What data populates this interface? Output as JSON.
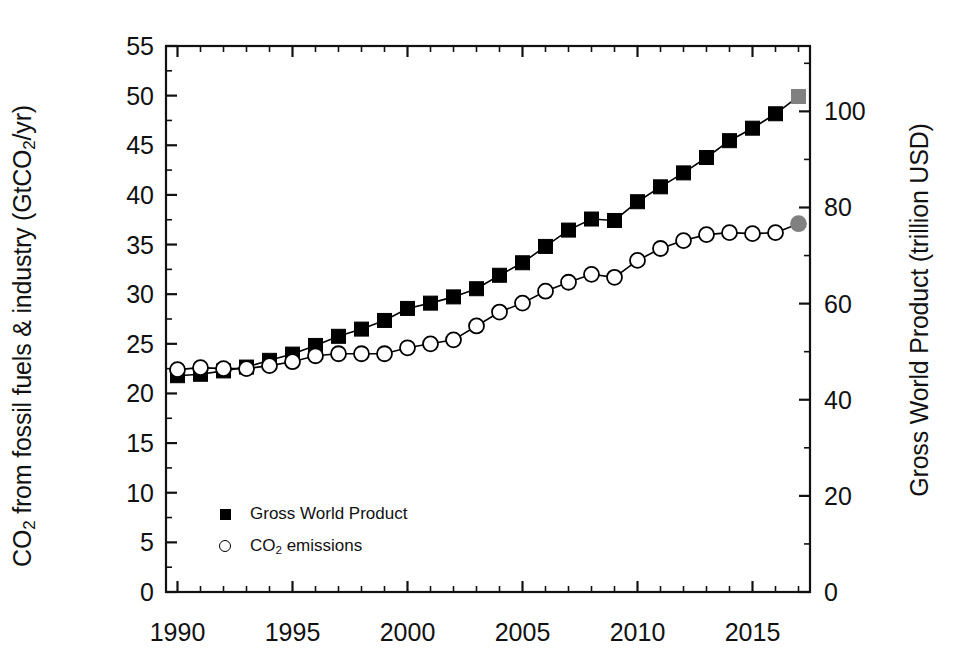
{
  "chart_data": {
    "type": "line",
    "title": "",
    "xlabel": "",
    "ylabel": "CO2 from fossil fuels & industry (GtCO2/yr)",
    "ylabel_right": "Gross World Product (trillion USD)",
    "x": [
      1990,
      1991,
      1992,
      1993,
      1994,
      1995,
      1996,
      1997,
      1998,
      1999,
      2000,
      2001,
      2002,
      2003,
      2004,
      2005,
      2006,
      2007,
      2008,
      2009,
      2010,
      2011,
      2012,
      2013,
      2014,
      2015,
      2016,
      2017
    ],
    "xlim": [
      1989.5,
      2017.5
    ],
    "xticks": [
      1990,
      1995,
      2000,
      2005,
      2010,
      2015
    ],
    "xtick_labels": [
      "1990",
      "1995",
      "2000",
      "2005",
      "2010",
      "2015"
    ],
    "xminor_step": 1,
    "ylim": [
      0,
      55
    ],
    "yticks": [
      0,
      5,
      10,
      15,
      20,
      25,
      30,
      35,
      40,
      45,
      50,
      55
    ],
    "ytick_labels": [
      "0",
      "5",
      "10",
      "15",
      "20",
      "25",
      "30",
      "35",
      "40",
      "45",
      "50",
      "55"
    ],
    "ylim_right": [
      0,
      113.6
    ],
    "yticks_right": [
      0,
      20,
      40,
      60,
      80,
      100
    ],
    "ytick_labels_right": [
      "0",
      "20",
      "40",
      "60",
      "80",
      "100"
    ],
    "grid": false,
    "legend_position": "lower-left",
    "series": [
      {
        "name": "Gross World Product",
        "axis": "right",
        "units": "trillion USD",
        "marker": "filled-square",
        "color": "#000000",
        "last_point_color": "#808080",
        "values": [
          45.0,
          45.3,
          46.0,
          46.8,
          48.2,
          49.5,
          51.3,
          53.2,
          54.7,
          56.5,
          59.0,
          60.1,
          61.4,
          63.1,
          65.9,
          68.5,
          71.9,
          75.3,
          77.6,
          77.3,
          81.2,
          84.3,
          87.2,
          90.4,
          93.9,
          96.5,
          99.5,
          103.1
        ]
      },
      {
        "name": "CO2 emissions",
        "axis": "left",
        "units": "GtCO2/yr",
        "marker": "open-circle",
        "color": "#000000",
        "last_point_color": "#808080",
        "values": [
          22.4,
          22.6,
          22.5,
          22.5,
          22.8,
          23.2,
          23.8,
          24.0,
          24.0,
          24.0,
          24.6,
          25.0,
          25.4,
          26.8,
          28.2,
          29.1,
          30.3,
          31.2,
          32.0,
          31.7,
          33.4,
          34.6,
          35.4,
          36.0,
          36.2,
          36.1,
          36.2,
          37.1
        ]
      }
    ]
  },
  "axes": {
    "left_title_parts": {
      "pre": "CO",
      "sub1": "2",
      "mid": " from fossil fuels & industry (GtCO",
      "sub2": "2",
      "post": "/yr)"
    },
    "right_title": "Gross World Product (trillion USD)"
  },
  "legend": {
    "items": [
      {
        "label": "Gross World Product",
        "marker": "filled-square"
      },
      {
        "label": "CO2 emissions",
        "marker": "open-circle",
        "label_pre": "CO",
        "label_sub": "2",
        "label_post": " emissions"
      }
    ]
  },
  "colors": {
    "line": "#000000",
    "axis": "#111111",
    "highlight": "#808080",
    "background": "#ffffff"
  }
}
